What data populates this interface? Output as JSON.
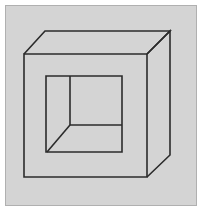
{
  "figure": {
    "canvas": {
      "width": 204,
      "height": 214,
      "background": "#ffffff"
    },
    "panel": {
      "name": "figure-panel",
      "x": 5,
      "y": 5,
      "width": 191,
      "height": 200,
      "fill": "#d4d4d4",
      "stroke": "#b0b0b0",
      "stroke_width": 1
    },
    "style": {
      "line_color": "#2b2b2b",
      "line_width": 1.6,
      "line_join": "miter",
      "line_cap": "butt",
      "fill": "none"
    },
    "vertices": {
      "front_top_left": {
        "x": 24,
        "y": 54
      },
      "front_top_right": {
        "x": 147,
        "y": 54
      },
      "front_bottom_right": {
        "x": 147,
        "y": 177
      },
      "front_bottom_left": {
        "x": 24,
        "y": 177
      },
      "back_top_left": {
        "x": 45,
        "y": 31
      },
      "back_top_right": {
        "x": 170,
        "y": 31
      },
      "back_bottom_right": {
        "x": 170,
        "y": 155
      },
      "aperture_top_left": {
        "x": 46,
        "y": 76
      },
      "aperture_top_right": {
        "x": 122,
        "y": 76
      },
      "aperture_bottom_right": {
        "x": 122,
        "y": 152
      },
      "aperture_bottom_left": {
        "x": 46,
        "y": 152
      },
      "interior_corner": {
        "x": 70,
        "y": 125
      }
    },
    "paths": {
      "front_face": "M 24 54 L 147 54 L 147 177 L 24 177 Z",
      "top_face": "M 24 54 L 45 31 L 170 31 L 147 54",
      "right_face": "M 147 54 L 170 31 L 170 155 L 147 177",
      "aperture_square": "M 46 76 L 122 76 L 122 152 L 46 152 Z",
      "interior_vertical": "M 70 76 L 70 125",
      "interior_horizontal": "M 70 125 L 122 125",
      "interior_diagonal": "M 70 125 L 47 152"
    },
    "edge_labels": {
      "front_face": "front-face-outline",
      "top_face": "top-face-edges",
      "right_face": "right-face-edges",
      "aperture_square": "aperture-square-outline",
      "interior_vertical": "interior-vertical-edge",
      "interior_horizontal": "interior-horizontal-edge",
      "interior_diagonal": "interior-diagonal-edge"
    }
  }
}
